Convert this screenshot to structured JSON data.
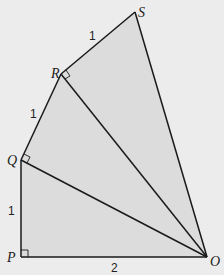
{
  "diagram": {
    "vertices": {
      "S": {
        "label": "S",
        "x": 135,
        "y": 12
      },
      "R": {
        "label": "R",
        "x": 61,
        "y": 74
      },
      "Q": {
        "label": "Q",
        "x": 21,
        "y": 160
      },
      "P": {
        "label": "P",
        "x": 21,
        "y": 257
      },
      "O": {
        "label": "O",
        "x": 207,
        "y": 257
      }
    },
    "segment_labels": {
      "RS": "1",
      "QR": "1",
      "PQ": "1",
      "PO": "2"
    },
    "right_angles": [
      "P",
      "Q",
      "R"
    ],
    "colors": {
      "background": "#ececec",
      "fill": "#dcdcdc",
      "stroke": "#1a1a1a"
    }
  }
}
